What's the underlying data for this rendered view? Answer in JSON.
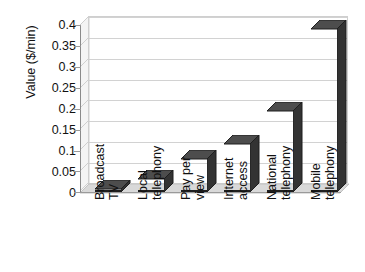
{
  "chart_data": {
    "type": "bar",
    "title": "",
    "subtitle": "",
    "xlabel": "",
    "ylabel": "Value ($/min)",
    "ylim": [
      0,
      0.4
    ],
    "yticks": [
      "0",
      "0.05",
      "0.1",
      "0.15",
      "0.2",
      "0.25",
      "0.3",
      "0.35",
      "0.4"
    ],
    "ytick_values": [
      0,
      0.05,
      0.1,
      0.15,
      0.2,
      0.25,
      0.3,
      0.35,
      0.4
    ],
    "grid": true,
    "legend": false,
    "legend_position": "none",
    "style": "3d-column",
    "categories": [
      "Broadcast TV",
      "Local telephony",
      "Pay per view",
      "Internet access",
      "National telephony",
      "Mobile telephony"
    ],
    "category_lines": [
      [
        "Broadcast",
        "TV"
      ],
      [
        "Local",
        "telephony"
      ],
      [
        "Pay per",
        "view"
      ],
      [
        "Internet",
        "access"
      ],
      [
        "National",
        "telephony"
      ],
      [
        "Mobile",
        "telephony"
      ]
    ],
    "values": [
      0.005,
      0.03,
      0.08,
      0.115,
      0.195,
      0.39
    ],
    "annotations": []
  },
  "colors": {
    "bar_front": "#a6a6a6",
    "bar_side": "#333333",
    "bar_top": "#4d4d4d",
    "bar_outline": "#1f1f1f",
    "gridline": "#d2d2d2",
    "floor": "#d9d9d9",
    "wall_left": "#efefef",
    "axis": "#8a8a8a",
    "text": "#111111",
    "background": "#ffffff"
  }
}
